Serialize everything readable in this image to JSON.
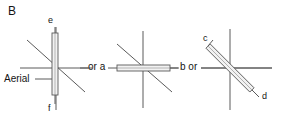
{
  "figure": {
    "panel_label": "B",
    "background": "#ffffff",
    "stroke_color": "#5a5a5a",
    "text_color": "#141414",
    "aerial_fill": "#f2f2f2",
    "width": 281,
    "height": 127
  },
  "labels": {
    "panel": "B",
    "aerial": "Aerial",
    "e": "e",
    "f": "f",
    "c": "c",
    "d": "d",
    "connector_1": "or a",
    "connector_2": "b or"
  },
  "diagrams": [
    {
      "id": "diagram-vertical-aerial",
      "name": "vertical-aerial",
      "center": [
        56,
        68
      ],
      "aerial_orientation": "vertical",
      "aerial_angle_deg": 90,
      "endpoint_labels": {
        "top": "e",
        "bottom": "f"
      },
      "axes": [
        "horizontal",
        "vertical",
        "diagonal-descending"
      ],
      "callout": "Aerial"
    },
    {
      "id": "diagram-horizontal-aerial",
      "name": "horizontal-aerial",
      "center": [
        143,
        68
      ],
      "aerial_orientation": "horizontal",
      "aerial_angle_deg": 0,
      "endpoint_labels": {
        "left": "a",
        "right": "b"
      },
      "axes": [
        "horizontal",
        "vertical",
        "diagonal-descending"
      ],
      "callout": ""
    },
    {
      "id": "diagram-diagonal-aerial",
      "name": "diagonal-aerial",
      "center": [
        230,
        68
      ],
      "aerial_orientation": "diagonal",
      "aerial_angle_deg": -45,
      "endpoint_labels": {
        "upper_left": "c",
        "lower_right": "d"
      },
      "axes": [
        "horizontal",
        "vertical"
      ],
      "callout": ""
    }
  ]
}
